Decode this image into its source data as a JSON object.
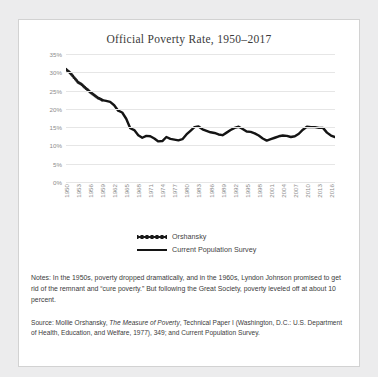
{
  "card": {
    "title": "Official Poverty Rate, 1950–2017"
  },
  "legend": [
    {
      "label": "Orshansky",
      "style": "dotted"
    },
    {
      "label": "Current Population Survey",
      "style": "solid"
    }
  ],
  "notes": {
    "text": "Notes: In the 1950s, poverty dropped dramatically, and in the 1960s, Lyndon Johnson promised to get rid of the remnant and “cure poverty.”  But following the Great Society, poverty leveled off at about 10 percent."
  },
  "source": {
    "prefix": "Source: Mollie Orshansky, ",
    "italic": "The Measure of Poverty",
    "suffix": ", Technical Paper I (Washington, D.C.: U.S. Department of Health, Education, and Welfare, 1977), 349;  and Current Population Survey."
  },
  "chart_data": {
    "type": "line",
    "title": "Official Poverty Rate, 1950–2017",
    "xlabel": "",
    "ylabel": "",
    "ylim": [
      0,
      35
    ],
    "yticks": [
      "0%",
      "5%",
      "10%",
      "15%",
      "20%",
      "25%",
      "30%",
      "35%"
    ],
    "ytick_values": [
      0,
      5,
      10,
      15,
      20,
      25,
      30,
      35
    ],
    "xlim": [
      1950,
      2017
    ],
    "xticks": [
      1950,
      1953,
      1956,
      1959,
      1962,
      1965,
      1968,
      1971,
      1974,
      1977,
      1980,
      1983,
      1986,
      1989,
      1992,
      1995,
      1998,
      2001,
      2004,
      2007,
      2010,
      2013,
      2016
    ],
    "grid": true,
    "legend_position": "bottom",
    "series": [
      {
        "name": "Orshansky",
        "style": "dotted",
        "color": "#1a1a1a",
        "x": [
          1950,
          1951,
          1952,
          1953,
          1954,
          1955,
          1956,
          1957,
          1958,
          1959
        ],
        "values": [
          30.8,
          29.9,
          28.6,
          27.3,
          26.6,
          25.6,
          24.6,
          23.8,
          23.0,
          22.4
        ]
      },
      {
        "name": "Current Population Survey",
        "style": "solid",
        "color": "#141414",
        "x": [
          1959,
          1960,
          1961,
          1962,
          1963,
          1964,
          1965,
          1966,
          1967,
          1968,
          1969,
          1970,
          1971,
          1972,
          1973,
          1974,
          1975,
          1976,
          1977,
          1978,
          1979,
          1980,
          1981,
          1982,
          1983,
          1984,
          1985,
          1986,
          1987,
          1988,
          1989,
          1990,
          1991,
          1992,
          1993,
          1994,
          1995,
          1996,
          1997,
          1998,
          1999,
          2000,
          2001,
          2002,
          2003,
          2004,
          2005,
          2006,
          2007,
          2008,
          2009,
          2010,
          2011,
          2012,
          2013,
          2014,
          2015,
          2016,
          2017
        ],
        "values": [
          22.4,
          22.2,
          21.9,
          21.0,
          19.5,
          19.0,
          17.3,
          14.7,
          14.2,
          12.8,
          12.1,
          12.6,
          12.5,
          11.9,
          11.1,
          11.2,
          12.3,
          11.8,
          11.6,
          11.4,
          11.7,
          13.0,
          14.0,
          15.0,
          15.2,
          14.4,
          14.0,
          13.6,
          13.4,
          13.0,
          12.8,
          13.5,
          14.2,
          14.8,
          15.1,
          14.5,
          13.8,
          13.7,
          13.3,
          12.7,
          11.9,
          11.3,
          11.7,
          12.1,
          12.5,
          12.7,
          12.6,
          12.3,
          12.5,
          13.2,
          14.3,
          15.1,
          15.0,
          15.0,
          14.8,
          14.8,
          13.5,
          12.7,
          12.3
        ]
      }
    ]
  }
}
